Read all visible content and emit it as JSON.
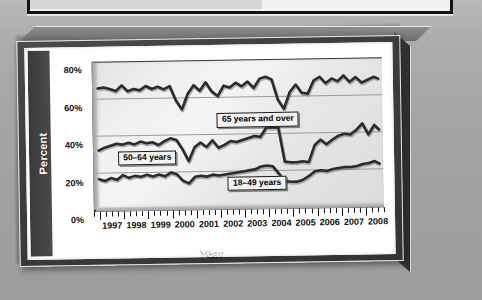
{
  "chart_data": {
    "type": "line",
    "title": "",
    "xlabel": "Year",
    "ylabel": "Percent",
    "ylim": [
      0,
      80
    ],
    "xlim": [
      1996.75,
      2008.75
    ],
    "grid": true,
    "legend_position": "inline-annotations",
    "y_ticks": [
      "0%",
      "20%",
      "40%",
      "60%",
      "80%"
    ],
    "y_tick_values": [
      0,
      20,
      40,
      60,
      80
    ],
    "x_ticks": [
      "1997",
      "1998",
      "1999",
      "2000",
      "2001",
      "2002",
      "2003",
      "2004",
      "2005",
      "2006",
      "2007",
      "2008"
    ],
    "x_tick_values": [
      1997,
      1998,
      1999,
      2000,
      2001,
      2002,
      2003,
      2004,
      2005,
      2006,
      2007,
      2008
    ],
    "minor_ticks_per_year": 4,
    "series": [
      {
        "name": "65 years and over",
        "color": "#2b2b2b",
        "x": [
          1996.9,
          1997.15,
          1997.4,
          1997.65,
          1997.9,
          1998.15,
          1998.4,
          1998.65,
          1998.9,
          1999.15,
          1999.4,
          1999.65,
          1999.9,
          2000.15,
          2000.4,
          2000.65,
          2000.9,
          2001.15,
          2001.4,
          2001.65,
          2001.9,
          2002.15,
          2002.4,
          2002.65,
          2002.9,
          2003.15,
          2003.4,
          2003.65,
          2003.9,
          2004.15,
          2004.4,
          2004.65,
          2004.9,
          2005.15,
          2005.4,
          2005.65,
          2005.9,
          2006.15,
          2006.4,
          2006.65,
          2006.9,
          2007.15,
          2007.4,
          2007.65,
          2007.9,
          2008.15,
          2008.4,
          2008.6
        ],
        "y": [
          65.5,
          66.0,
          65.2,
          64.0,
          67.0,
          63.8,
          65.0,
          64.2,
          66.5,
          64.8,
          66.0,
          64.5,
          66.2,
          58.5,
          53.5,
          62.0,
          66.5,
          63.5,
          68.0,
          63.0,
          60.5,
          66.0,
          65.0,
          67.5,
          65.5,
          68.0,
          64.5,
          69.5,
          70.5,
          69.0,
          58.0,
          53.0,
          62.0,
          66.0,
          61.5,
          61.0,
          68.0,
          70.0,
          66.5,
          69.0,
          67.5,
          70.5,
          67.0,
          69.5,
          66.5,
          68.0,
          69.5,
          68.5
        ],
        "annotation": {
          "text": "65 years and over",
          "x_pct": 42.5,
          "y_pct": 36.0
        }
      },
      {
        "name": "50–64 years",
        "color": "#2b2b2b",
        "x": [
          1996.9,
          1997.15,
          1997.4,
          1997.65,
          1997.9,
          1998.15,
          1998.4,
          1998.65,
          1998.9,
          1999.15,
          1999.4,
          1999.65,
          1999.9,
          2000.15,
          2000.4,
          2000.65,
          2000.9,
          2001.15,
          2001.4,
          2001.65,
          2001.9,
          2002.15,
          2002.4,
          2002.65,
          2002.9,
          2003.15,
          2003.4,
          2003.65,
          2003.9,
          2004.15,
          2004.4,
          2004.65,
          2004.9,
          2005.15,
          2005.4,
          2005.65,
          2005.9,
          2006.15,
          2006.4,
          2006.65,
          2006.9,
          2007.15,
          2007.4,
          2007.65,
          2007.9,
          2008.15,
          2008.4,
          2008.6
        ],
        "y": [
          32.0,
          33.5,
          34.5,
          35.5,
          35.0,
          36.0,
          35.0,
          36.5,
          35.5,
          36.0,
          34.5,
          36.5,
          38.0,
          37.0,
          32.0,
          25.5,
          33.0,
          35.5,
          33.0,
          36.5,
          32.5,
          34.0,
          36.0,
          35.5,
          36.5,
          37.5,
          38.5,
          38.0,
          43.0,
          43.0,
          43.0,
          24.5,
          24.0,
          24.0,
          24.5,
          24.0,
          33.0,
          36.0,
          33.5,
          36.0,
          38.0,
          39.0,
          38.5,
          41.0,
          44.5,
          38.5,
          43.5,
          41.0
        ],
        "annotation": {
          "text": "50–64 years",
          "x_pct": 8.0,
          "y_pct": 60.5
        }
      },
      {
        "name": "18–49 years",
        "color": "#2b2b2b",
        "x": [
          1996.9,
          1997.15,
          1997.4,
          1997.65,
          1997.9,
          1998.15,
          1998.4,
          1998.65,
          1998.9,
          1999.15,
          1999.4,
          1999.65,
          1999.9,
          2000.15,
          2000.4,
          2000.65,
          2000.9,
          2001.15,
          2001.4,
          2001.65,
          2001.9,
          2002.15,
          2002.4,
          2002.65,
          2002.9,
          2003.15,
          2003.4,
          2003.65,
          2003.9,
          2004.15,
          2004.4,
          2004.65,
          2004.9,
          2005.15,
          2005.4,
          2005.65,
          2005.9,
          2006.15,
          2006.4,
          2006.65,
          2006.9,
          2007.15,
          2007.4,
          2007.65,
          2007.9,
          2008.15,
          2008.4,
          2008.6
        ],
        "y": [
          16.5,
          15.5,
          17.0,
          16.0,
          18.5,
          17.0,
          18.0,
          17.5,
          18.5,
          17.5,
          18.5,
          17.5,
          19.5,
          18.5,
          15.0,
          13.5,
          17.0,
          17.5,
          17.0,
          18.0,
          17.5,
          18.0,
          18.5,
          19.0,
          19.5,
          20.0,
          20.5,
          22.0,
          22.5,
          22.0,
          18.0,
          14.0,
          13.5,
          13.5,
          14.5,
          16.5,
          19.0,
          19.5,
          19.0,
          20.0,
          20.5,
          21.0,
          21.0,
          21.5,
          22.5,
          23.0,
          24.0,
          22.5
        ],
        "annotation": {
          "text": "18–49 years",
          "x_pct": 46.0,
          "y_pct": 79.0
        }
      }
    ]
  },
  "axis": {
    "y_title": "Percent",
    "x_title": "Year"
  }
}
